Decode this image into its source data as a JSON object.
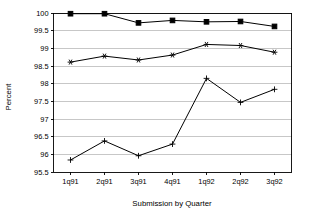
{
  "chart_data": {
    "type": "line",
    "title": "",
    "xlabel": "Submission by Quarter",
    "ylabel": "Percent",
    "categories": [
      "1q91",
      "2q91",
      "3q91",
      "4q91",
      "1q92",
      "2q92",
      "3q92"
    ],
    "x": [
      "1q91",
      "2q91",
      "3q91",
      "4q91",
      "1q92",
      "2q92",
      "3q92"
    ],
    "ylim": [
      95.5,
      100
    ],
    "yticks": [
      95.5,
      96,
      96.5,
      97,
      97.5,
      98,
      98.5,
      99,
      99.5,
      100
    ],
    "ytick_labels": [
      "95.5",
      "96",
      "96.5",
      "97",
      "97.5",
      "98",
      "98.5",
      "99",
      "99.5",
      "100"
    ],
    "grid": true,
    "legend": "none",
    "series": [
      {
        "name": "series-top",
        "marker": "filled-square",
        "values": [
          99.98,
          99.98,
          99.72,
          99.79,
          99.75,
          99.76,
          99.62
        ]
      },
      {
        "name": "series-middle",
        "marker": "star",
        "values": [
          98.61,
          98.78,
          98.67,
          98.81,
          99.11,
          99.08,
          98.89
        ]
      },
      {
        "name": "series-bottom",
        "marker": "plus",
        "values": [
          95.84,
          96.38,
          95.96,
          96.29,
          98.15,
          97.47,
          97.84
        ]
      }
    ],
    "colors": {
      "line": "#000000",
      "grid": "#b9b9b9",
      "axis": "#000000",
      "background": "#ffffff"
    }
  }
}
